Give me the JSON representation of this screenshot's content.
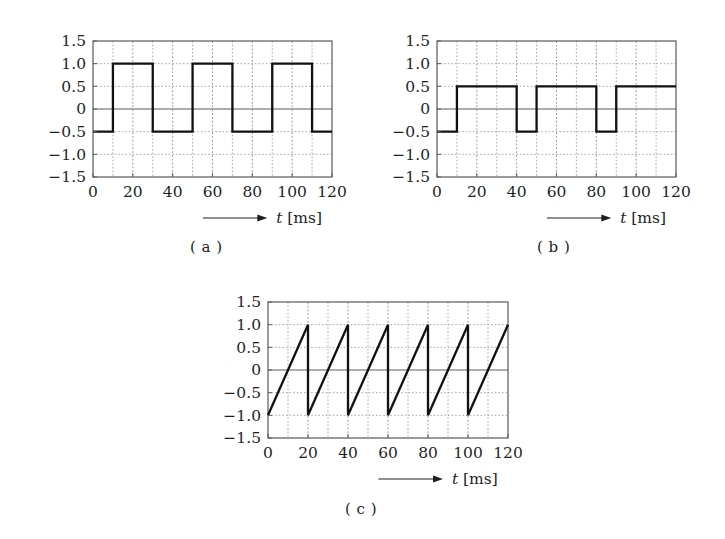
{
  "figure": {
    "background_color": "#ffffff",
    "line_color": "#111111",
    "grid_color": "#9a9a9a",
    "frame_color": "#4a4a4a",
    "axis_caption_symbol": "t",
    "axis_caption_unit": "[ms]",
    "arrow_glyph": "arrow-right"
  },
  "panels": [
    {
      "id": "a",
      "caption": "( a )",
      "chart_data": {
        "type": "line",
        "title": "",
        "xlabel": "t [ms]",
        "ylabel": "",
        "xlim": [
          0,
          120
        ],
        "ylim": [
          -1.5,
          1.5
        ],
        "xticks": [
          0,
          20,
          40,
          60,
          80,
          100,
          120
        ],
        "xtick_labels": [
          "0",
          "20",
          "40",
          "60",
          "80",
          "100",
          "120"
        ],
        "yticks": [
          1.5,
          1.0,
          0.5,
          0,
          -0.5,
          -1.0,
          -1.5
        ],
        "ytick_labels": [
          "1.5",
          "1.0",
          "0.5",
          "0",
          "−0.5",
          "−1.0",
          "−1.5"
        ],
        "x_minor_step": 10,
        "y_minor_step": 0.5,
        "grid": true,
        "zero_line": true,
        "legend": "none",
        "waveform": "square",
        "period_ms": 40,
        "high_level": 1.0,
        "low_level": -0.5,
        "series": [
          {
            "name": "signal-a",
            "x": [
              0,
              10,
              10,
              30,
              30,
              50,
              50,
              70,
              70,
              90,
              90,
              110,
              110,
              120
            ],
            "values": [
              -0.5,
              -0.5,
              1.0,
              1.0,
              -0.5,
              -0.5,
              1.0,
              1.0,
              -0.5,
              -0.5,
              1.0,
              1.0,
              -0.5,
              -0.5
            ]
          }
        ]
      }
    },
    {
      "id": "b",
      "caption": "( b )",
      "chart_data": {
        "type": "line",
        "title": "",
        "xlabel": "t [ms]",
        "ylabel": "",
        "xlim": [
          0,
          120
        ],
        "ylim": [
          -1.5,
          1.5
        ],
        "xticks": [
          0,
          20,
          40,
          60,
          80,
          100,
          120
        ],
        "xtick_labels": [
          "0",
          "20",
          "40",
          "60",
          "80",
          "100",
          "120"
        ],
        "yticks": [
          1.5,
          1.0,
          0.5,
          0,
          -0.5,
          -1.0,
          -1.5
        ],
        "ytick_labels": [
          "1.5",
          "1.0",
          "0.5",
          "0",
          "−0.5",
          "−1.0",
          "−1.5"
        ],
        "x_minor_step": 10,
        "y_minor_step": 0.5,
        "grid": true,
        "zero_line": true,
        "legend": "none",
        "waveform": "square",
        "period_ms": 40,
        "high_level": 0.5,
        "low_level": -0.5,
        "series": [
          {
            "name": "signal-b",
            "x": [
              0,
              10,
              10,
              40,
              40,
              50,
              50,
              80,
              80,
              90,
              90,
              120
            ],
            "values": [
              -0.5,
              -0.5,
              0.5,
              0.5,
              -0.5,
              -0.5,
              0.5,
              0.5,
              -0.5,
              -0.5,
              0.5,
              0.5
            ]
          }
        ]
      }
    },
    {
      "id": "c",
      "caption": "( c )",
      "chart_data": {
        "type": "line",
        "title": "",
        "xlabel": "t [ms]",
        "ylabel": "",
        "xlim": [
          0,
          120
        ],
        "ylim": [
          -1.5,
          1.5
        ],
        "xticks": [
          0,
          20,
          40,
          60,
          80,
          100,
          120
        ],
        "xtick_labels": [
          "0",
          "20",
          "40",
          "60",
          "80",
          "100",
          "120"
        ],
        "yticks": [
          1.5,
          1.0,
          0.5,
          0,
          -0.5,
          -1.0,
          -1.5
        ],
        "ytick_labels": [
          "1.5",
          "1.0",
          "0.5",
          "0",
          "−0.5",
          "−1.0",
          "−1.5"
        ],
        "x_minor_step": 10,
        "y_minor_step": 0.5,
        "grid": true,
        "zero_line": true,
        "legend": "none",
        "waveform": "sawtooth",
        "period_ms": 20,
        "peak_level": 1.0,
        "trough_level": -1.0,
        "series": [
          {
            "name": "signal-c",
            "x": [
              0,
              20,
              20,
              40,
              40,
              60,
              60,
              80,
              80,
              100,
              100,
              120
            ],
            "values": [
              -1.0,
              1.0,
              -1.0,
              1.0,
              -1.0,
              1.0,
              -1.0,
              1.0,
              -1.0,
              1.0,
              -1.0,
              1.0
            ]
          }
        ]
      }
    }
  ]
}
